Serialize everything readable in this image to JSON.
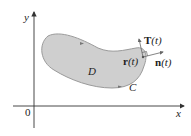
{
  "diagram": {
    "axes": {
      "x_label": "x",
      "y_label": "y",
      "origin_label": "0"
    },
    "region": {
      "label": "D",
      "fill": "#cfcfcf",
      "stroke": "#9a9a9a"
    },
    "curve": {
      "label": "C"
    },
    "point": {
      "label_bold": "r",
      "label_arg": "(t)"
    },
    "tangent": {
      "label_bold": "T",
      "label_arg": "(t)"
    },
    "normal": {
      "label_bold": "n",
      "label_arg": "(t)"
    }
  }
}
